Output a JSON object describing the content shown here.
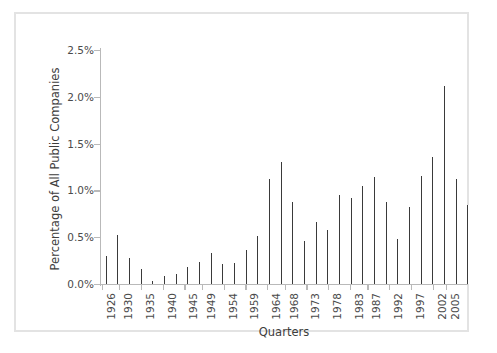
{
  "chart_data": {
    "type": "bar",
    "title": "",
    "xlabel": "Quarters",
    "ylabel": "Percentage of All Public Companies",
    "ylim": [
      0,
      2.5
    ],
    "ytick_labels": [
      "0.0%",
      "0.5%",
      "1.0%",
      "1.5%",
      "2.0%",
      "2.5%"
    ],
    "ytick_values": [
      0.0,
      0.5,
      1.0,
      1.5,
      2.0,
      2.5
    ],
    "xtick_labels": [
      "1926",
      "1930",
      "1935",
      "1940",
      "1945",
      "1949",
      "1954",
      "1959",
      "1964",
      "1968",
      "1973",
      "1978",
      "1983",
      "1987",
      "1992",
      "1997",
      "2002",
      "2005"
    ],
    "xtick_indices": [
      0,
      16,
      36,
      56,
      76,
      92,
      112,
      132,
      152,
      168,
      188,
      208,
      228,
      244,
      264,
      284,
      304,
      316
    ],
    "grid": false,
    "legend": false,
    "x_start_year": 1926,
    "x_end_year": 2005,
    "period": "quarterly",
    "bar_color": "#3a3a3a",
    "axis_color": "#b9b9b9",
    "values": [
      0.3,
      0.12,
      0.22,
      0.17,
      0.42,
      0.3,
      0.51,
      0.24,
      0.18,
      0.46,
      0.33,
      0.55,
      0.62,
      0.4,
      0.71,
      0.52,
      0.58,
      0.84,
      0.66,
      0.79,
      0.45,
      0.38,
      0.27,
      0.33,
      0.2,
      0.15,
      0.28,
      0.14,
      0.1,
      0.06,
      0.04,
      0.05,
      0.03,
      0.05,
      0.04,
      0.03,
      0.02,
      0.16,
      0.15,
      0.14,
      0.16,
      0.14,
      0.12,
      0.05,
      0.04,
      0.03,
      0.02,
      0.03,
      0.02,
      0.03,
      0.04,
      0.02,
      0.03,
      0.12,
      0.05,
      0.04,
      0.03,
      0.05,
      0.09,
      0.06,
      0.05,
      0.08,
      0.14,
      0.1,
      0.12,
      0.07,
      0.16,
      0.13,
      0.18,
      0.11,
      0.22,
      0.15,
      0.12,
      0.24,
      0.17,
      0.13,
      0.25,
      0.14,
      0.21,
      0.18,
      0.3,
      0.19,
      0.16,
      0.11,
      0.24,
      0.14,
      0.18,
      0.27,
      0.16,
      0.13,
      0.23,
      0.2,
      0.31,
      0.18,
      0.26,
      0.35,
      0.22,
      0.16,
      0.28,
      0.41,
      0.25,
      0.33,
      0.47,
      0.3,
      0.36,
      0.52,
      0.28,
      0.44,
      0.34,
      0.58,
      0.26,
      0.21,
      0.48,
      0.31,
      0.57,
      0.24,
      0.14,
      0.19,
      0.33,
      0.27,
      0.42,
      0.18,
      0.22,
      0.36,
      0.47,
      0.29,
      0.55,
      0.24,
      0.35,
      0.52,
      0.31,
      0.46,
      0.4,
      0.36,
      0.58,
      0.44,
      0.62,
      0.48,
      0.75,
      0.55,
      0.42,
      0.88,
      0.6,
      0.51,
      0.95,
      0.66,
      0.58,
      0.72,
      1.05,
      0.62,
      0.81,
      0.7,
      0.92,
      0.74,
      1.12,
      0.85,
      0.78,
      1.24,
      0.9,
      1.0,
      1.32,
      1.12,
      1.52,
      1.22,
      1.41,
      1.3,
      1.45,
      1.2,
      1.05,
      1.18,
      0.92,
      1.0,
      0.85,
      0.95,
      0.76,
      0.88,
      0.72,
      0.95,
      0.66,
      0.8,
      0.58,
      0.74,
      1.0,
      0.62,
      0.52,
      0.7,
      0.46,
      0.58,
      0.64,
      0.4,
      0.55,
      0.48,
      0.36,
      0.6,
      0.44,
      0.52,
      0.3,
      0.66,
      0.42,
      0.58,
      0.7,
      0.48,
      0.62,
      0.75,
      0.52,
      0.8,
      0.66,
      0.58,
      0.85,
      0.7,
      0.92,
      0.74,
      0.64,
      1.0,
      0.82,
      1.1,
      0.88,
      1.22,
      0.95,
      1.05,
      1.3,
      1.0,
      0.9,
      1.15,
      0.96,
      1.08,
      0.88,
      1.0,
      1.12,
      0.92,
      1.04,
      0.85,
      0.95,
      1.1,
      0.9,
      1.02,
      0.88,
      1.16,
      0.98,
      1.05,
      0.92,
      1.24,
      1.02,
      1.12,
      1.3,
      1.08,
      1.18,
      1.0,
      1.22,
      1.4,
      1.14,
      1.86,
      1.26,
      1.34,
      1.1,
      1.52,
      1.2,
      1.05,
      1.3,
      0.98,
      1.1,
      0.88,
      1.02,
      0.8,
      0.92,
      0.7,
      0.84,
      0.62,
      0.74,
      0.55,
      0.66,
      0.48,
      0.58,
      0.3,
      0.42,
      0.26,
      0.36,
      0.5,
      0.62,
      0.45,
      0.7,
      0.55,
      0.82,
      0.66,
      0.9,
      0.75,
      1.0,
      0.85,
      1.12,
      0.95,
      1.22,
      1.05,
      1.32,
      1.15,
      1.44,
      1.24,
      1.52,
      1.3,
      1.62,
      1.4,
      1.7,
      1.48,
      1.58,
      1.36,
      1.66,
      1.44,
      1.75,
      1.55,
      1.85,
      1.6,
      1.95,
      1.72,
      2.05,
      1.8,
      2.12,
      1.9,
      1.68,
      1.4,
      1.2,
      0.95,
      0.82,
      0.7,
      0.88,
      0.75,
      0.92,
      1.12,
      0.85,
      1.05,
      0.78,
      1.18,
      0.9,
      1.25,
      1.0,
      1.3,
      1.1,
      0.84
    ]
  }
}
